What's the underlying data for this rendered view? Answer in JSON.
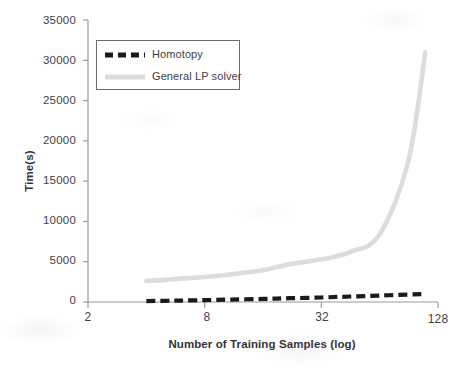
{
  "chart_data": {
    "type": "line",
    "title": "",
    "xlabel": "Number of Training Samples (log)",
    "ylabel": "Time(s)",
    "xscale": "log2",
    "xlim": [
      2,
      128
    ],
    "ylim": [
      0,
      35000
    ],
    "xticks": [
      2,
      8,
      32,
      128
    ],
    "xticklabels": [
      "2",
      "8",
      "32",
      "128"
    ],
    "yticks": [
      0,
      5000,
      10000,
      15000,
      20000,
      25000,
      30000,
      35000
    ],
    "yticklabels": [
      "0",
      "5000",
      "10000",
      "15000",
      "20000",
      "25000",
      "30000",
      "35000"
    ],
    "grid": false,
    "legend_position": "upper-left-inside",
    "series": [
      {
        "name": "Homotopy",
        "style": "dashed",
        "color": "#1a1a1a",
        "x": [
          4,
          5,
          6,
          8,
          11,
          16,
          22,
          32,
          45,
          64,
          90,
          110
        ],
        "values": [
          120,
          150,
          180,
          230,
          300,
          380,
          470,
          560,
          680,
          800,
          930,
          1000
        ]
      },
      {
        "name": "General LP solver",
        "style": "solid",
        "color": "#dcdcdc",
        "x": [
          4,
          5,
          6,
          8,
          11,
          16,
          22,
          32,
          45,
          64,
          90,
          110
        ],
        "values": [
          2600,
          2750,
          2900,
          3100,
          3450,
          3950,
          4700,
          5300,
          6200,
          8400,
          17500,
          31000
        ]
      }
    ]
  },
  "legend": {
    "entries": [
      {
        "label": "Homotopy",
        "swatch": "dashed-black-line"
      },
      {
        "label": "General LP solver",
        "swatch": "solid-gray-line"
      }
    ]
  },
  "axes": {
    "y_title": "Time(s)",
    "x_title": "Number of Training Samples (log)",
    "y_tick_labels": [
      "35000",
      "30000",
      "25000",
      "20000",
      "15000",
      "10000",
      "5000",
      "0"
    ],
    "x_tick_labels": [
      "2",
      "8",
      "32",
      "128"
    ]
  },
  "colors": {
    "homotopy": "#1a1a1a",
    "lp_solver": "#dcdcdc",
    "axis": "#9a9a9a",
    "text": "#3f3f3f"
  }
}
